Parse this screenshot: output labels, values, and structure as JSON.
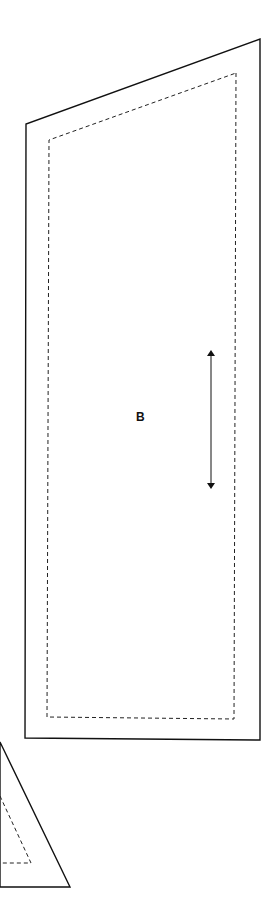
{
  "pattern": {
    "pieces": [
      {
        "id": "B",
        "label": "B",
        "cut_outline": "260,39 260,740 25,738 26,124",
        "seam_line": "236,73 234,719 47,717 49,140",
        "grainline": {
          "x": 211,
          "y1": 351,
          "y2": 488
        }
      },
      {
        "id": "partial-triangle",
        "cut_outline": "0,742 70,887 0,887",
        "seam_line": "0,796 31,863 0,863"
      }
    ],
    "colors": {
      "line": "#111111",
      "background": "#ffffff"
    }
  }
}
